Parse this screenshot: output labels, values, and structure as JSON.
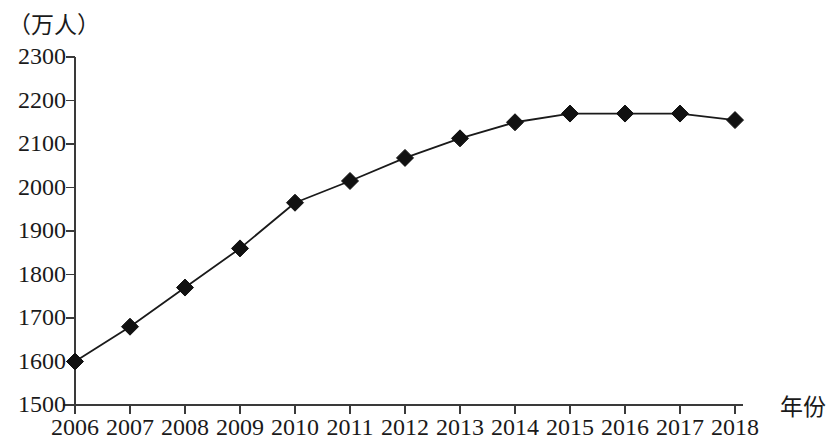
{
  "chart_data": {
    "type": "line",
    "title": "",
    "subtitle": "",
    "xlabel": "年份",
    "ylabel": "（万人）",
    "ylim": [
      1500,
      2300
    ],
    "ytick_step": 100,
    "yticks": [
      "2300",
      "2200",
      "2100",
      "2000",
      "1900",
      "1800",
      "1700",
      "1600",
      "1500"
    ],
    "ytick_values": [
      2300,
      2200,
      2100,
      2000,
      1900,
      1800,
      1700,
      1600,
      1500
    ],
    "grid": false,
    "legend": "none",
    "marker": "filled-diamond",
    "line_color": "#1a1a1a",
    "marker_color": "#111111",
    "axis_color": "#3a3a3a",
    "categories": [
      "2006",
      "2007",
      "2008",
      "2009",
      "2010",
      "2011",
      "2012",
      "2013",
      "2014",
      "2015",
      "2016",
      "2017",
      "2018"
    ],
    "x": [
      2006,
      2007,
      2008,
      2009,
      2010,
      2011,
      2012,
      2013,
      2014,
      2015,
      2016,
      2017,
      2018
    ],
    "values": [
      1600,
      1680,
      1770,
      1860,
      1965,
      2015,
      2068,
      2113,
      2150,
      2170,
      2170,
      2170,
      2155
    ],
    "series": [
      {
        "name": "",
        "values": [
          1600,
          1680,
          1770,
          1860,
          1965,
          2015,
          2068,
          2113,
          2150,
          2170,
          2170,
          2170,
          2155
        ]
      }
    ],
    "annotations": []
  },
  "axis": {
    "y_unit_label": "（万人）",
    "x_axis_title": "年份"
  }
}
